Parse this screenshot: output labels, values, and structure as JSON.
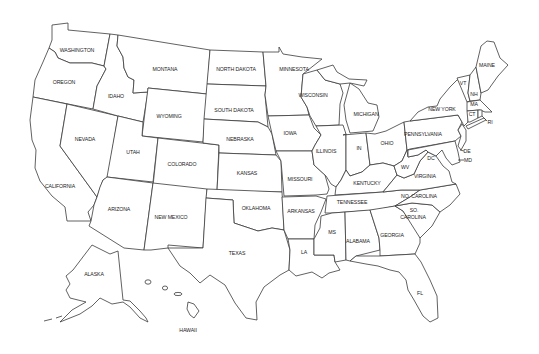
{
  "map": {
    "title": "United States outline map",
    "background": "#ffffff",
    "stroke_color": "#3a3a3a",
    "label_color": "#222222",
    "states": [
      {
        "id": "WA",
        "label": "WASHINGTON",
        "x": 77,
        "y": 51
      },
      {
        "id": "OR",
        "label": "OREGON",
        "x": 64,
        "y": 83
      },
      {
        "id": "CA",
        "label": "CALIFORNIA",
        "x": 60,
        "y": 187
      },
      {
        "id": "ID",
        "label": "IDAHO",
        "x": 116,
        "y": 97
      },
      {
        "id": "NV",
        "label": "NEVADA",
        "x": 85,
        "y": 140
      },
      {
        "id": "MT",
        "label": "MONTANA",
        "x": 165,
        "y": 70
      },
      {
        "id": "WY",
        "label": "WYOMING",
        "x": 169,
        "y": 117
      },
      {
        "id": "UT",
        "label": "UTAH",
        "x": 133,
        "y": 153
      },
      {
        "id": "CO",
        "label": "COLORADO",
        "x": 182,
        "y": 165
      },
      {
        "id": "AZ",
        "label": "ARIZONA",
        "x": 119,
        "y": 211
      },
      {
        "id": "NM",
        "label": "NEW MEXICO",
        "x": 171,
        "y": 218
      },
      {
        "id": "ND",
        "label": "NORTH DAKOTA",
        "x": 236,
        "y": 70
      },
      {
        "id": "SD",
        "label": "SOUTH DAKOTA",
        "x": 234,
        "y": 111
      },
      {
        "id": "NE",
        "label": "NEBRASKA",
        "x": 240,
        "y": 140
      },
      {
        "id": "KS",
        "label": "KANSAS",
        "x": 247,
        "y": 174
      },
      {
        "id": "OK",
        "label": "OKLAHOMA",
        "x": 256,
        "y": 209
      },
      {
        "id": "TX",
        "label": "TEXAS",
        "x": 237,
        "y": 254
      },
      {
        "id": "MN",
        "label": "MINNESOTA",
        "x": 294,
        "y": 70
      },
      {
        "id": "IA",
        "label": "IOWA",
        "x": 290,
        "y": 134
      },
      {
        "id": "MO",
        "label": "MISSOURI",
        "x": 300,
        "y": 180
      },
      {
        "id": "AR",
        "label": "ARKANSAS",
        "x": 301,
        "y": 212
      },
      {
        "id": "LA",
        "label": "LA",
        "x": 304,
        "y": 253
      },
      {
        "id": "WI",
        "label": "WISCONSIN",
        "x": 313,
        "y": 96
      },
      {
        "id": "IL",
        "label": "ILLINOIS",
        "x": 326,
        "y": 152
      },
      {
        "id": "MI",
        "label": "MICHIGAN",
        "x": 366,
        "y": 115
      },
      {
        "id": "IN",
        "label": "IN",
        "x": 359,
        "y": 149
      },
      {
        "id": "OH",
        "label": "OHIO",
        "x": 387,
        "y": 144
      },
      {
        "id": "KY",
        "label": "KENTUCKY",
        "x": 367,
        "y": 184
      },
      {
        "id": "TN",
        "label": "TENNESSEE",
        "x": 352,
        "y": 203
      },
      {
        "id": "MS",
        "label": "MS",
        "x": 332,
        "y": 233
      },
      {
        "id": "AL",
        "label": "ALABAMA",
        "x": 358,
        "y": 242
      },
      {
        "id": "GA",
        "label": "GEORGIA",
        "x": 392,
        "y": 236
      },
      {
        "id": "FL",
        "label": "FL",
        "x": 420,
        "y": 294
      },
      {
        "id": "SC",
        "label": "SO.",
        "x": 414,
        "y": 211
      },
      {
        "id": "SC2",
        "label": "CAROLINA",
        "x": 413,
        "y": 218
      },
      {
        "id": "NC",
        "label": "NO. CAROLINA",
        "x": 419,
        "y": 197
      },
      {
        "id": "VA",
        "label": "VIRGINIA",
        "x": 425,
        "y": 177
      },
      {
        "id": "WV",
        "label": "WV",
        "x": 405,
        "y": 168
      },
      {
        "id": "DC",
        "label": "DC",
        "x": 431,
        "y": 159
      },
      {
        "id": "PA",
        "label": "PENNSYLVANIA",
        "x": 423,
        "y": 135
      },
      {
        "id": "NY",
        "label": "NEW YORK",
        "x": 442,
        "y": 110
      },
      {
        "id": "VT",
        "label": "VT",
        "x": 463,
        "y": 84
      },
      {
        "id": "NH",
        "label": "NH",
        "x": 474,
        "y": 95
      },
      {
        "id": "ME",
        "label": "MAINE",
        "x": 487,
        "y": 66
      },
      {
        "id": "MA",
        "label": "MA",
        "x": 474,
        "y": 105
      },
      {
        "id": "CT",
        "label": "CT",
        "x": 468,
        "y": 113
      },
      {
        "id": "RI",
        "label": "RI",
        "x": 490,
        "y": 123
      },
      {
        "id": "DE",
        "label": "DE",
        "x": 467,
        "y": 152
      },
      {
        "id": "MD",
        "label": "MD",
        "x": 468,
        "y": 161
      },
      {
        "id": "AK",
        "label": "ALASKA",
        "x": 94,
        "y": 275
      },
      {
        "id": "HI",
        "label": "HAWAII",
        "x": 188,
        "y": 331
      }
    ]
  }
}
